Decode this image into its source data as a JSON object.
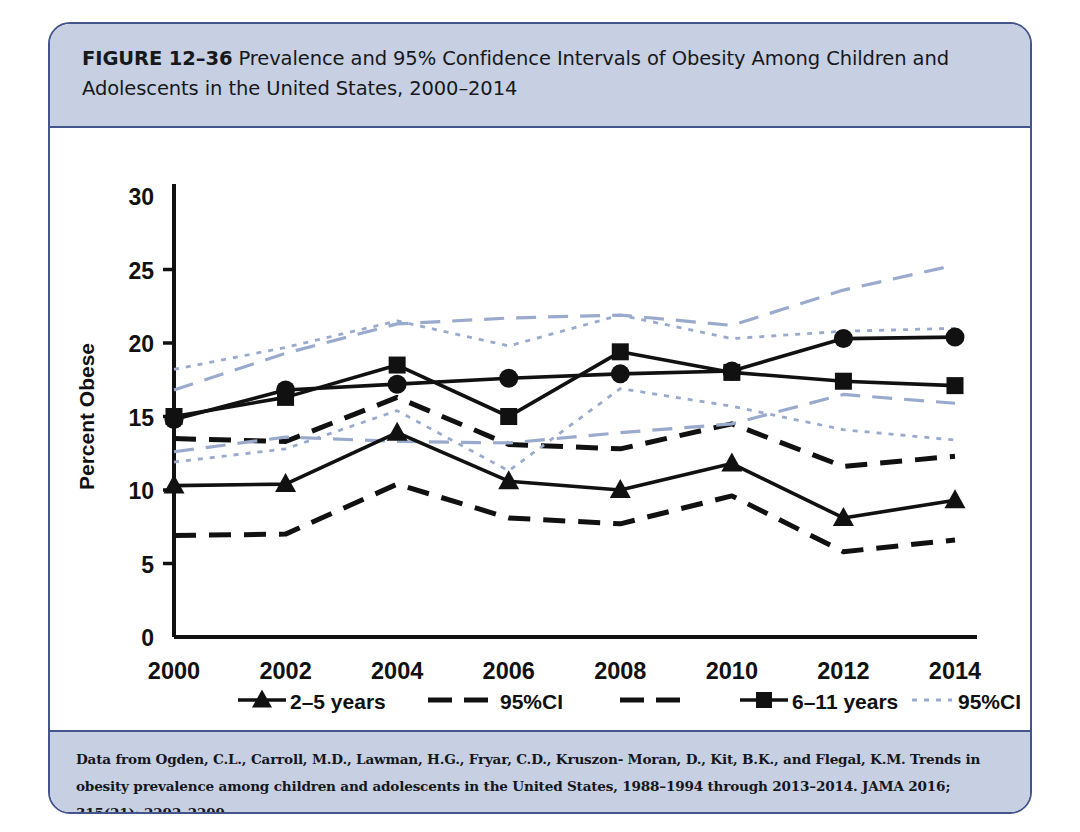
{
  "figure": {
    "number": "FIGURE 12–36",
    "title_rest": " Prevalence and 95% Confidence Intervals of Obesity Among Children and Adolescents in the United States, 2000–2014",
    "source": "Data from Ogden, C.L., Carroll, M.D., Lawman, H.G., Fryar, C.D., Kruszon- Moran, D., Kit, B.K., and Flegal, K.M. Trends in obesity prevalence among children and adolescents in the United States, 1988–1994 through 2013–2014. JAMA 2016; 315(21): 2292–2299."
  },
  "colors": {
    "frame_border": "#44558c",
    "band_bg": "#c6d0e2",
    "plot_bg": "#ffffff",
    "series_black": "#111111",
    "ci_blue": "#9aaacd"
  },
  "axis": {
    "y_ticks": [
      "0",
      "5",
      "10",
      "15",
      "20",
      "25",
      "30"
    ],
    "x_ticks": [
      "2000",
      "2002",
      "2004",
      "2006",
      "2008",
      "2010",
      "2012",
      "2014"
    ]
  },
  "legend": {
    "row1": [
      {
        "label": "2–5 years",
        "marker": "triangle",
        "style": "solid"
      },
      {
        "label": "95%CI",
        "marker": "none",
        "style": "dashed-black"
      },
      {
        "label": "",
        "marker": "none",
        "style": "dashed-black"
      },
      {
        "label": "6–11 years",
        "marker": "square",
        "style": "solid"
      },
      {
        "label": "95%CI",
        "marker": "none",
        "style": "dotted-blue"
      }
    ],
    "row2": [
      {
        "label": "",
        "marker": "none",
        "style": "dotted-blue"
      },
      {
        "label": "12–19 years",
        "marker": "circle",
        "style": "solid"
      },
      {
        "label": "95%CI",
        "marker": "none",
        "style": "dashed-blue"
      },
      {
        "label": "",
        "marker": "none",
        "style": "dashed-blue"
      }
    ]
  },
  "chart_data": {
    "type": "line",
    "title": "Prevalence and 95% Confidence Intervals of Obesity Among Children and Adolescents in the United States, 2000–2014",
    "xlabel": "",
    "ylabel": "Percent Obese",
    "x": [
      2000,
      2002,
      2004,
      2006,
      2008,
      2010,
      2012,
      2014
    ],
    "ylim": [
      0,
      30
    ],
    "ytick_step": 5,
    "grid": false,
    "legend_position": "bottom",
    "series": [
      {
        "name": "2–5 years",
        "marker": "triangle",
        "style": "solid",
        "color": "#111111",
        "values": [
          10.3,
          10.4,
          13.9,
          10.6,
          10.0,
          11.8,
          8.1,
          9.3
        ]
      },
      {
        "name": "2–5 years 95%CI upper",
        "marker": "none",
        "style": "dashed",
        "color": "#111111",
        "values": [
          13.5,
          13.3,
          16.3,
          13.1,
          12.8,
          14.5,
          11.6,
          12.3
        ]
      },
      {
        "name": "2–5 years 95%CI lower",
        "marker": "none",
        "style": "dashed",
        "color": "#111111",
        "values": [
          6.9,
          7.0,
          10.4,
          8.1,
          7.7,
          9.6,
          5.8,
          6.6
        ]
      },
      {
        "name": "6–11 years",
        "marker": "square",
        "style": "solid",
        "color": "#111111",
        "values": [
          15.0,
          16.3,
          18.5,
          15.0,
          19.4,
          18.0,
          17.4,
          17.1
        ]
      },
      {
        "name": "6–11 years 95%CI upper",
        "marker": "none",
        "style": "dotted",
        "color": "#9aaacd",
        "values": [
          18.2,
          19.7,
          21.5,
          19.8,
          21.9,
          20.3,
          20.8,
          21.0
        ]
      },
      {
        "name": "6–11 years 95%CI lower",
        "marker": "none",
        "style": "dotted",
        "color": "#9aaacd",
        "values": [
          11.9,
          12.8,
          15.4,
          11.3,
          16.9,
          15.7,
          14.1,
          13.4
        ]
      },
      {
        "name": "12–19 years",
        "marker": "circle",
        "style": "solid",
        "color": "#111111",
        "values": [
          14.8,
          16.8,
          17.2,
          17.6,
          17.9,
          18.1,
          20.3,
          20.4
        ]
      },
      {
        "name": "12–19 years 95%CI upper",
        "marker": "none",
        "style": "dashed",
        "color": "#9aaacd",
        "values": [
          16.8,
          19.3,
          21.3,
          21.7,
          21.9,
          21.2,
          23.6,
          25.3
        ]
      },
      {
        "name": "12–19 years 95%CI lower",
        "marker": "none",
        "style": "dashed",
        "color": "#9aaacd",
        "values": [
          12.6,
          13.6,
          13.3,
          13.2,
          13.9,
          14.5,
          16.5,
          15.9
        ]
      }
    ]
  }
}
